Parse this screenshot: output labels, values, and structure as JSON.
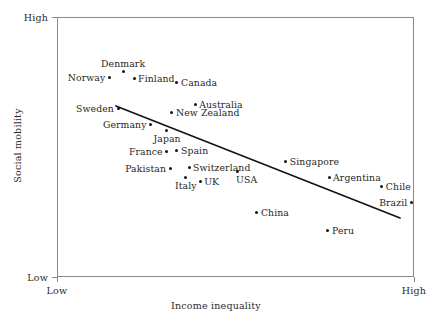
{
  "chart_data": {
    "type": "scatter",
    "title": "",
    "xlabel": "Income inequality",
    "ylabel": "Social mobility",
    "xlim": [
      "Low",
      "High"
    ],
    "ylim": [
      "Low",
      "High"
    ],
    "x_tick_labels": [
      "Low",
      "High"
    ],
    "y_tick_labels": [
      "Low",
      "High"
    ],
    "grid": false,
    "legend": null,
    "axes_note": "Qualitative axes: only Low and High endpoints are labelled; no numeric ticks.",
    "trendline": {
      "present": true,
      "description": "Straight downward-sloping best-fit line running from upper-left to lower-right",
      "x_start_frac": 0.165,
      "y_start_frac": 0.658,
      "x_end_frac": 0.961,
      "y_end_frac": 0.227,
      "color": "#141414"
    },
    "points": [
      {
        "label": "Norway",
        "x_frac": 0.148,
        "y_frac": 0.769,
        "label_pos": "left"
      },
      {
        "label": "Denmark",
        "x_frac": 0.185,
        "y_frac": 0.792,
        "label_pos": "above"
      },
      {
        "label": "Finland",
        "x_frac": 0.216,
        "y_frac": 0.762,
        "label_pos": "right"
      },
      {
        "label": "Canada",
        "x_frac": 0.336,
        "y_frac": 0.75,
        "label_pos": "right"
      },
      {
        "label": "Australia",
        "x_frac": 0.387,
        "y_frac": 0.665,
        "label_pos": "right"
      },
      {
        "label": "New Zealand",
        "x_frac": 0.322,
        "y_frac": 0.631,
        "label_pos": "right"
      },
      {
        "label": "Sweden",
        "x_frac": 0.171,
        "y_frac": 0.65,
        "label_pos": "left"
      },
      {
        "label": "Germany",
        "x_frac": 0.263,
        "y_frac": 0.588,
        "label_pos": "left"
      },
      {
        "label": "Japan",
        "x_frac": 0.308,
        "y_frac": 0.562,
        "label_pos": "below"
      },
      {
        "label": "France",
        "x_frac": 0.308,
        "y_frac": 0.481,
        "label_pos": "left"
      },
      {
        "label": "Spain",
        "x_frac": 0.336,
        "y_frac": 0.488,
        "label_pos": "right"
      },
      {
        "label": "Pakistan",
        "x_frac": 0.317,
        "y_frac": 0.419,
        "label_pos": "left"
      },
      {
        "label": "Switzerland",
        "x_frac": 0.37,
        "y_frac": 0.423,
        "label_pos": "right"
      },
      {
        "label": "Italy",
        "x_frac": 0.361,
        "y_frac": 0.381,
        "label_pos": "below"
      },
      {
        "label": "UK",
        "x_frac": 0.401,
        "y_frac": 0.369,
        "label_pos": "right"
      },
      {
        "label": "USA",
        "x_frac": 0.507,
        "y_frac": 0.404,
        "label_pos": "below-right"
      },
      {
        "label": "Singapore",
        "x_frac": 0.641,
        "y_frac": 0.446,
        "label_pos": "right"
      },
      {
        "label": "Argentina",
        "x_frac": 0.762,
        "y_frac": 0.381,
        "label_pos": "right"
      },
      {
        "label": "Chile",
        "x_frac": 0.91,
        "y_frac": 0.35,
        "label_pos": "right"
      },
      {
        "label": "Brazil",
        "x_frac": 0.992,
        "y_frac": 0.285,
        "label_pos": "left"
      },
      {
        "label": "China",
        "x_frac": 0.56,
        "y_frac": 0.25,
        "label_pos": "right"
      },
      {
        "label": "Peru",
        "x_frac": 0.759,
        "y_frac": 0.177,
        "label_pos": "right"
      }
    ]
  },
  "axes": {
    "x_title": "Income inequality",
    "y_title": "Social mobility",
    "x_low": "Low",
    "x_high": "High",
    "y_low": "Low",
    "y_high": "High"
  },
  "style": {
    "point_color": "#141414",
    "line_color": "#141414",
    "frame_color": "#8a8a8a",
    "text_color": "#1f1f1f"
  }
}
